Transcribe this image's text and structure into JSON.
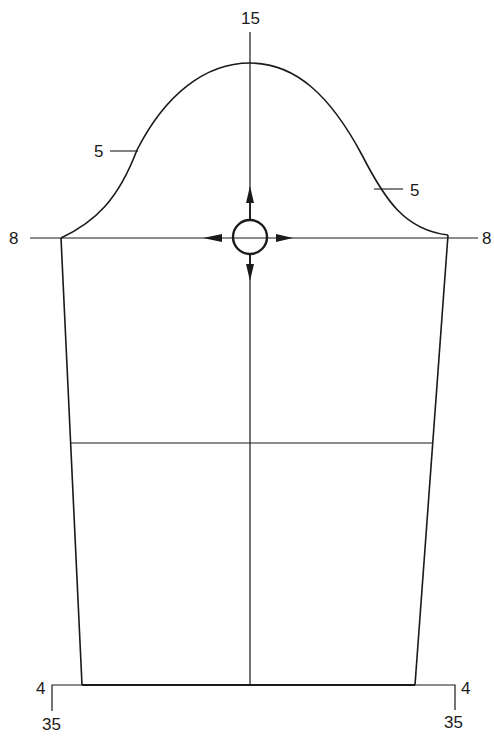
{
  "diagram": {
    "type": "sleeve-pattern",
    "labels": {
      "top": "15",
      "cap_left": "5",
      "cap_right": "5",
      "bicep_left": "8",
      "bicep_right": "8",
      "hem_left_inset": "4",
      "hem_right_inset": "4",
      "length_left": "35",
      "length_right": "35"
    },
    "stroke_color": "#1a1a1a",
    "background": "#ffffff"
  }
}
